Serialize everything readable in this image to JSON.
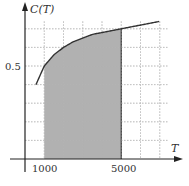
{
  "chart_data": {
    "type": "area",
    "title": "",
    "xlabel": "T",
    "ylabel": "C(T)",
    "x_tick_labels": [
      "1000",
      "5000"
    ],
    "y_tick_labels": [
      "0.5"
    ],
    "x_grid": [
      1000,
      2000,
      3000,
      4000,
      5000,
      6000,
      7000
    ],
    "y_grid": [
      0.1,
      0.2,
      0.3,
      0.4,
      0.5,
      0.6,
      0.7
    ],
    "grid": true,
    "grid_style": "dotted",
    "xlim": [
      0,
      7800
    ],
    "ylim": [
      0,
      0.8
    ],
    "curve": {
      "name": "C(T)",
      "x": [
        570,
        1000,
        1500,
        2000,
        2500,
        3000,
        3500,
        4000,
        4500,
        5000,
        5500,
        6000,
        6500,
        7000
      ],
      "y": [
        0.4,
        0.5,
        0.56,
        0.6,
        0.63,
        0.65,
        0.67,
        0.68,
        0.69,
        0.7,
        0.71,
        0.72,
        0.73,
        0.74
      ]
    },
    "shaded_region": {
      "from": 1000,
      "to": 5000,
      "color": "#a9a9a9"
    },
    "colors": {
      "curve": "#333333",
      "axis": "#222222",
      "grid": "#bbbbbb",
      "fill": "#a9a9a9"
    }
  },
  "labels": {
    "y_axis": "C(T)",
    "x_axis": "T",
    "x_tick_1000": "1000",
    "x_tick_5000": "5000",
    "y_tick_05": "0.5"
  }
}
